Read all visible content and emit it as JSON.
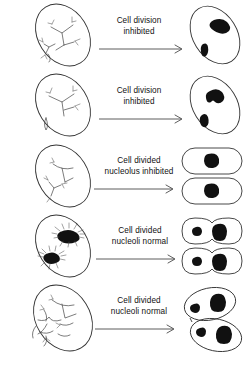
{
  "figure": {
    "background_color": "#ffffff",
    "line_color": "#333333",
    "nucleolus_color": "#111111",
    "text_color": "#111111",
    "rows": [
      {
        "id": "row-1",
        "label_line1": "Cell division",
        "label_line2": "inhibited",
        "left_cell": {
          "shape": "tilted-oval",
          "contents": "branched chromosome threads with arrows"
        },
        "right_cells": [
          {
            "shape": "tilted-oval",
            "nucleoli": 2,
            "nucleoli_sizes": [
              "large-irregular",
              "small"
            ]
          }
        ],
        "arrow": "right-arrow"
      },
      {
        "id": "row-2",
        "label_line1": "Cell division",
        "label_line2": "inhibited",
        "left_cell": {
          "shape": "tilted-oval",
          "contents": "branched chromosome threads with arrows"
        },
        "right_cells": [
          {
            "shape": "tilted-oval",
            "nucleoli": 2,
            "nucleoli_sizes": [
              "large-irregular",
              "small"
            ]
          }
        ],
        "arrow": "right-arrow"
      },
      {
        "id": "row-3",
        "label_line1": "Cell divided",
        "label_line2": "nucleolus inhibited",
        "left_cell": {
          "shape": "tilted-oval",
          "contents": "sparse chromosome threads with arrows"
        },
        "right_cells": [
          {
            "shape": "capsule",
            "nucleoli": 1,
            "nucleoli_sizes": [
              "large"
            ]
          },
          {
            "shape": "capsule",
            "nucleoli": 1,
            "nucleoli_sizes": [
              "large"
            ]
          }
        ],
        "arrow": "right-arrow"
      },
      {
        "id": "row-4",
        "label_line1": "Cell divided",
        "label_line2": "nucleoli normal",
        "left_cell": {
          "shape": "tilted-oval",
          "contents": "two dense starburst chromosome clusters"
        },
        "right_cells": [
          {
            "shape": "waisted-capsule",
            "nucleoli": 2,
            "nucleoli_sizes": [
              "small",
              "large"
            ]
          },
          {
            "shape": "waisted-capsule",
            "nucleoli": 2,
            "nucleoli_sizes": [
              "small",
              "large"
            ]
          }
        ],
        "arrow": "right-arrow"
      },
      {
        "id": "row-5",
        "label_line1": "Cell divided",
        "label_line2": "nucleoli normal",
        "left_cell": {
          "shape": "tilted-oval",
          "contents": "many thin branching chromosome threads"
        },
        "right_cells": [
          {
            "shape": "tilted-oval",
            "nucleoli": 2,
            "nucleoli_sizes": [
              "small",
              "large"
            ]
          },
          {
            "shape": "tilted-oval",
            "nucleoli": 2,
            "nucleoli_sizes": [
              "small",
              "large"
            ]
          }
        ],
        "arrow": "right-arrow"
      }
    ]
  }
}
